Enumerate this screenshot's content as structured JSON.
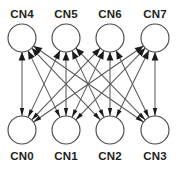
{
  "diagram": {
    "type": "directed-bipartite-graph",
    "background_color": "#ffffff",
    "node_fill_color": "#ffffff",
    "node_stroke_color": "#4a4a4a",
    "edge_color": "#5a5a5a",
    "arrowhead_color": "#1a1a1a",
    "label_color": "#231f20",
    "node_radius": 14,
    "rows": {
      "top": {
        "label_y": 18,
        "center_y": 38,
        "label_position": "above"
      },
      "bottom": {
        "label_y": 160,
        "center_y": 130,
        "label_position": "below"
      }
    },
    "nodes": [
      {
        "id": "CN4",
        "label": "CN4",
        "row": "top",
        "column": 0,
        "cx": 22,
        "cy": 38
      },
      {
        "id": "CN5",
        "label": "CN5",
        "row": "top",
        "column": 1,
        "cx": 66,
        "cy": 38
      },
      {
        "id": "CN6",
        "label": "CN6",
        "row": "top",
        "column": 2,
        "cx": 110,
        "cy": 38
      },
      {
        "id": "CN7",
        "label": "CN7",
        "row": "top",
        "column": 3,
        "cx": 155,
        "cy": 38
      },
      {
        "id": "CN0",
        "label": "CN0",
        "row": "bottom",
        "column": 0,
        "cx": 22,
        "cy": 130
      },
      {
        "id": "CN1",
        "label": "CN1",
        "row": "bottom",
        "column": 1,
        "cx": 66,
        "cy": 130
      },
      {
        "id": "CN2",
        "label": "CN2",
        "row": "bottom",
        "column": 2,
        "cx": 110,
        "cy": 130
      },
      {
        "id": "CN3",
        "label": "CN3",
        "row": "bottom",
        "column": 3,
        "cx": 155,
        "cy": 130
      }
    ],
    "edges": [
      {
        "from": "CN0",
        "to": "CN4",
        "bidirectional": true
      },
      {
        "from": "CN0",
        "to": "CN5",
        "bidirectional": true
      },
      {
        "from": "CN0",
        "to": "CN6",
        "bidirectional": true
      },
      {
        "from": "CN0",
        "to": "CN7",
        "bidirectional": true
      },
      {
        "from": "CN1",
        "to": "CN4",
        "bidirectional": true
      },
      {
        "from": "CN1",
        "to": "CN5",
        "bidirectional": true
      },
      {
        "from": "CN1",
        "to": "CN6",
        "bidirectional": true
      },
      {
        "from": "CN1",
        "to": "CN7",
        "bidirectional": true
      },
      {
        "from": "CN2",
        "to": "CN4",
        "bidirectional": true
      },
      {
        "from": "CN2",
        "to": "CN5",
        "bidirectional": true
      },
      {
        "from": "CN2",
        "to": "CN6",
        "bidirectional": true
      },
      {
        "from": "CN2",
        "to": "CN7",
        "bidirectional": true
      },
      {
        "from": "CN3",
        "to": "CN4",
        "bidirectional": true
      },
      {
        "from": "CN3",
        "to": "CN5",
        "bidirectional": true
      },
      {
        "from": "CN3",
        "to": "CN6",
        "bidirectional": true
      },
      {
        "from": "CN3",
        "to": "CN7",
        "bidirectional": true
      }
    ]
  }
}
